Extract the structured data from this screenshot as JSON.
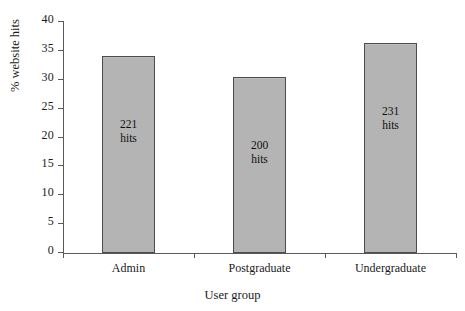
{
  "chart_data": {
    "type": "bar",
    "title": "",
    "xlabel": "User group",
    "ylabel": "% website hits",
    "categories": [
      "Admin",
      "Postgraduate",
      "Undergraduate"
    ],
    "values": [
      34.1,
      30.5,
      36.3
    ],
    "point_labels": [
      "221 hits",
      "200 hits",
      "231 hits"
    ],
    "point_label_lines": [
      [
        "221",
        "hits"
      ],
      [
        "200",
        "hits"
      ],
      [
        "231",
        "hits"
      ]
    ],
    "counts": [
      221,
      200,
      231
    ],
    "ylim": [
      0,
      40
    ],
    "ytick_values": [
      0,
      5,
      10,
      15,
      20,
      25,
      30,
      35,
      40
    ],
    "ytick_labels": [
      "0",
      "5",
      "10",
      "15",
      "20",
      "25",
      "30",
      "35",
      "40"
    ],
    "grid": false,
    "legend": null,
    "bar_fill_color": "#b4b4b4",
    "bar_border_color": "#4f4a52",
    "axis_color": "#5a5a5a",
    "background_color": "#ffffff"
  }
}
